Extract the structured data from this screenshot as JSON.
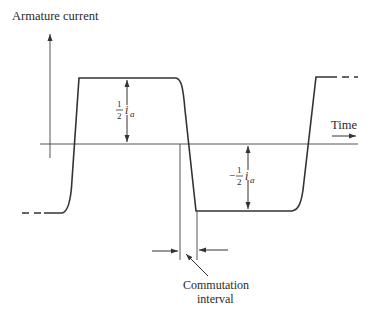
{
  "diagram": {
    "y_axis_label": "Armature current",
    "x_axis_label": "Time",
    "upper_amplitude": {
      "fraction_num": "1",
      "fraction_den": "2",
      "symbol": "i",
      "subscript": "a",
      "sign": ""
    },
    "lower_amplitude": {
      "fraction_num": "1",
      "fraction_den": "2",
      "symbol": "i",
      "subscript": "a",
      "sign": "−"
    },
    "commutation_label_line1": "Commutation",
    "commutation_label_line2": "interval",
    "colors": {
      "line": "#333333",
      "axis": "#555555",
      "text": "#2a2a2a"
    }
  }
}
